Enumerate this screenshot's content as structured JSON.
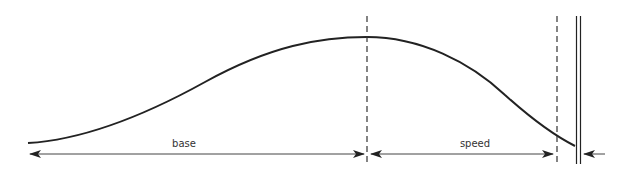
{
  "diagram": {
    "type": "profile-dimension-diagram",
    "stroke_color": "#222222",
    "labels": {
      "base": "base",
      "speed": "speed"
    },
    "curve": {
      "description": "smooth bell-like profile rising from left, peaking at first dashed line, descending to the right",
      "points": [
        [
          28,
          143
        ],
        [
          100,
          127
        ],
        [
          200,
          82
        ],
        [
          290,
          47
        ],
        [
          367,
          37
        ],
        [
          450,
          60
        ],
        [
          520,
          112
        ],
        [
          575,
          146
        ]
      ]
    },
    "vertical_lines": [
      {
        "name": "peak-divider",
        "style": "dashed",
        "x": 367
      },
      {
        "name": "speed-end-divider",
        "style": "dashed",
        "x": 557
      },
      {
        "name": "wall",
        "style": "double",
        "x": 578
      }
    ],
    "dimensions": [
      {
        "label": "base",
        "from_x": 30,
        "to_x": 365,
        "y": 154
      },
      {
        "label": "speed",
        "from_x": 370,
        "to_x": 554,
        "y": 154
      },
      {
        "label": "",
        "from_x": 604,
        "to_x": 583,
        "y": 154,
        "single_arrow": true
      }
    ]
  }
}
